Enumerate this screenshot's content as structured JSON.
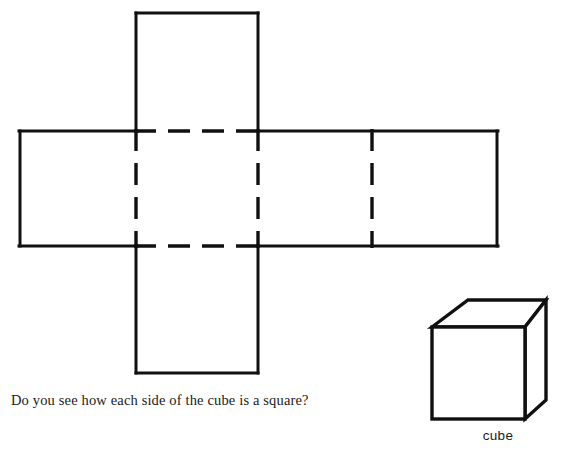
{
  "page": {
    "width": 588,
    "height": 456,
    "background_color": "#ffffff",
    "ink_color": "#101010"
  },
  "captions": {
    "question": "Do you see how each side of the cube is a square?",
    "cube_label": "cube"
  },
  "diagram": {
    "title_semantic": "cube-net-unfolded",
    "stroke_color": "#101010",
    "solid_stroke_width": 3,
    "dashed_stroke_width": 3.2,
    "dash_pattern": "22 12",
    "net": {
      "description": "Cross shaped net of a cube: six squares, fold lines dashed",
      "grid": {
        "left": 20,
        "col1": 136,
        "col2": 258,
        "col3": 372,
        "right": 497,
        "top": 13,
        "mid_top": 131,
        "mid_bottom": 246,
        "bottom": 373
      },
      "solid_segments": [
        {
          "name": "top-square-top",
          "x1": 136,
          "y1": 13,
          "x2": 258,
          "y2": 13
        },
        {
          "name": "top-square-left",
          "x1": 136,
          "y1": 13,
          "x2": 136,
          "y2": 131
        },
        {
          "name": "top-square-right",
          "x1": 258,
          "y1": 13,
          "x2": 258,
          "y2": 131
        },
        {
          "name": "band-left",
          "x1": 20,
          "y1": 131,
          "x2": 20,
          "y2": 246
        },
        {
          "name": "band-right",
          "x1": 497,
          "y1": 131,
          "x2": 497,
          "y2": 246
        },
        {
          "name": "band-top-left-run",
          "x1": 20,
          "y1": 131,
          "x2": 136,
          "y2": 131
        },
        {
          "name": "band-top-right-run",
          "x1": 258,
          "y1": 131,
          "x2": 497,
          "y2": 131
        },
        {
          "name": "band-bottom-left-run",
          "x1": 20,
          "y1": 246,
          "x2": 136,
          "y2": 246
        },
        {
          "name": "band-bottom-right-run",
          "x1": 258,
          "y1": 246,
          "x2": 497,
          "y2": 246
        },
        {
          "name": "bottom-square-left",
          "x1": 136,
          "y1": 246,
          "x2": 136,
          "y2": 373
        },
        {
          "name": "bottom-square-right",
          "x1": 258,
          "y1": 246,
          "x2": 258,
          "y2": 373
        },
        {
          "name": "bottom-square-bottom",
          "x1": 136,
          "y1": 373,
          "x2": 258,
          "y2": 373
        }
      ],
      "dashed_segments": [
        {
          "name": "fold-top-horizontal",
          "x1": 136,
          "y1": 131,
          "x2": 258,
          "y2": 131
        },
        {
          "name": "fold-bottom-horizontal",
          "x1": 136,
          "y1": 246,
          "x2": 258,
          "y2": 246
        },
        {
          "name": "fold-vertical-1",
          "x1": 136,
          "y1": 131,
          "x2": 136,
          "y2": 246
        },
        {
          "name": "fold-vertical-2",
          "x1": 258,
          "y1": 131,
          "x2": 258,
          "y2": 246
        },
        {
          "name": "fold-vertical-3",
          "x1": 372,
          "y1": 131,
          "x2": 372,
          "y2": 246
        }
      ]
    },
    "cube": {
      "description": "3D drawing of a cube in oblique projection",
      "front_face": {
        "left": 12,
        "top": 39,
        "right": 105,
        "bottom": 131
      },
      "depth_dx": 20,
      "depth_dy": -27,
      "vertices": {
        "front_top_left": [
          12,
          39
        ],
        "front_top_right": [
          105,
          39
        ],
        "front_bottom_left": [
          12,
          131
        ],
        "front_bottom_right": [
          105,
          131
        ],
        "back_top_left": [
          48,
          12
        ],
        "back_top_right": [
          126,
          12
        ],
        "back_bottom_right": [
          126,
          112
        ]
      }
    }
  }
}
